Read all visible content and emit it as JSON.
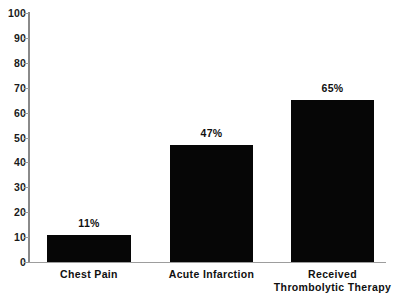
{
  "chart_data": {
    "type": "bar",
    "title": "",
    "subtitle": "",
    "xlabel": "",
    "ylabel": "",
    "categories": [
      "Chest Pain",
      "Acute Infarction",
      "Received\nThrombolytic Therapy"
    ],
    "values": [
      11,
      47,
      65
    ],
    "data_labels": [
      "11%",
      "47%",
      "65%"
    ],
    "ylim": [
      0,
      100
    ],
    "yticks": [
      0,
      10,
      20,
      30,
      40,
      50,
      60,
      70,
      80,
      90,
      100
    ],
    "ytick_labels": [
      "0",
      "10",
      "20",
      "30",
      "40",
      "50",
      "60",
      "70",
      "80",
      "90",
      "100"
    ],
    "grid": false,
    "legend": false,
    "legend_position": "none",
    "bar_color": "#060606",
    "axis_color": "#9a9a9a",
    "background_color": "#ffffff"
  },
  "axes": {
    "y_axis_name": "y-axis",
    "x_axis_name": "x-axis"
  }
}
